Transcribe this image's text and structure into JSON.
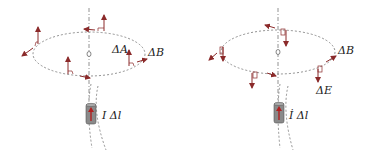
{
  "colors": {
    "vector": "#8b2a2a",
    "dashed": "#777777",
    "wire_body": "#8a8a8a",
    "wire_arrow": "#b02020",
    "text": "#222222"
  },
  "left_panel": {
    "label_area": "ΔA",
    "label_field": "ΔB",
    "label_current": "I Δl",
    "vector_direction": "up"
  },
  "right_panel": {
    "label_field": "ΔB",
    "label_efield": "ΔE",
    "label_current": "İ Δl",
    "vector_direction": "down"
  }
}
